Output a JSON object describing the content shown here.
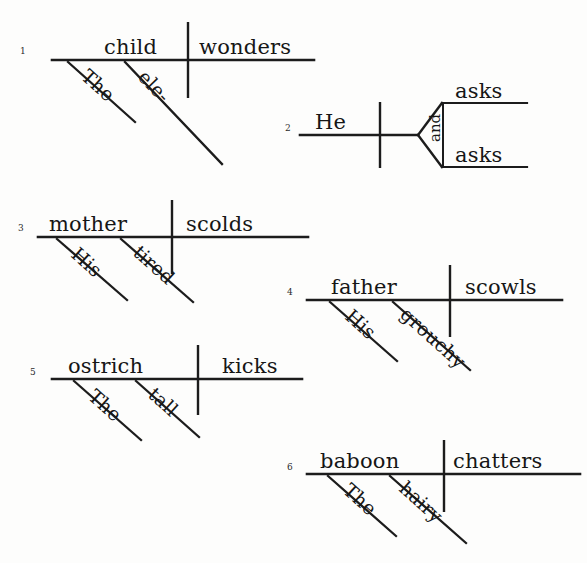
{
  "page": {
    "background_color": "#fdfdfc",
    "ink_color": "#1a1a1a",
    "width": 587,
    "height": 563
  },
  "diagrams": [
    {
      "number": "1",
      "subject": "child",
      "predicate": "wonders",
      "modifiers": [
        "The",
        "ele-"
      ],
      "sentence": "The ele- child wonders"
    },
    {
      "number": "2",
      "subject": "He",
      "predicate_compound": [
        "asks",
        "asks"
      ],
      "conjunction": "and",
      "modifiers": [],
      "sentence": "He asks and asks"
    },
    {
      "number": "3",
      "subject": "mother",
      "predicate": "scolds",
      "modifiers": [
        "His",
        "tired"
      ],
      "sentence": "His tired mother scolds"
    },
    {
      "number": "4",
      "subject": "father",
      "predicate": "scowls",
      "modifiers": [
        "His",
        "grouchy"
      ],
      "sentence": "His grouchy father scowls"
    },
    {
      "number": "5",
      "subject": "ostrich",
      "predicate": "kicks",
      "modifiers": [
        "The",
        "tall"
      ],
      "sentence": "The tall ostrich kicks"
    },
    {
      "number": "6",
      "subject": "baboon",
      "predicate": "chatters",
      "modifiers": [
        "The",
        "hairy"
      ],
      "sentence": "The hairy baboon chatters"
    }
  ]
}
